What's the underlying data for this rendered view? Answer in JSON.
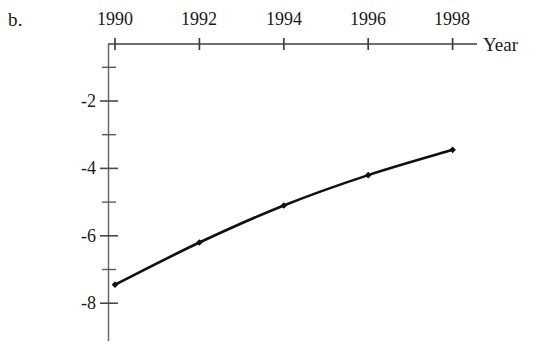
{
  "panel": {
    "label": "b."
  },
  "chart_data": {
    "type": "line",
    "title": "",
    "subtitle": "",
    "xlabel": "Year",
    "ylabel": "",
    "x": [
      1990,
      1992,
      1994,
      1996,
      1998
    ],
    "values": [
      -7.45,
      -6.2,
      -5.1,
      -4.2,
      -3.45
    ],
    "series": [
      {
        "name": "",
        "x": [
          1990,
          1992,
          1994,
          1996,
          1998
        ],
        "values": [
          -7.45,
          -6.2,
          -5.1,
          -4.2,
          -3.45
        ]
      }
    ],
    "xlim": [
      1989.85,
      1998.6
    ],
    "ylim": [
      -8.8,
      0.1
    ],
    "x_tick_labels": [
      "1990",
      "1992",
      "1994",
      "1996",
      "1998"
    ],
    "x_ticks": [
      1990,
      1992,
      1994,
      1996,
      1998
    ],
    "x_minor_ticks": [],
    "y_ticks": [
      -2,
      -4,
      -6,
      -8
    ],
    "y_tick_labels": [
      "-2",
      "-4",
      "-6",
      "-8"
    ],
    "y_minor_ticks": [
      -1,
      -3,
      -5,
      -7
    ],
    "grid": false,
    "legend": "none",
    "line_color": "#101010",
    "marker": "diamond",
    "marker_color": "#101010",
    "axis_color": "#4a4a4a",
    "background": "#ffffff",
    "annotations": []
  }
}
